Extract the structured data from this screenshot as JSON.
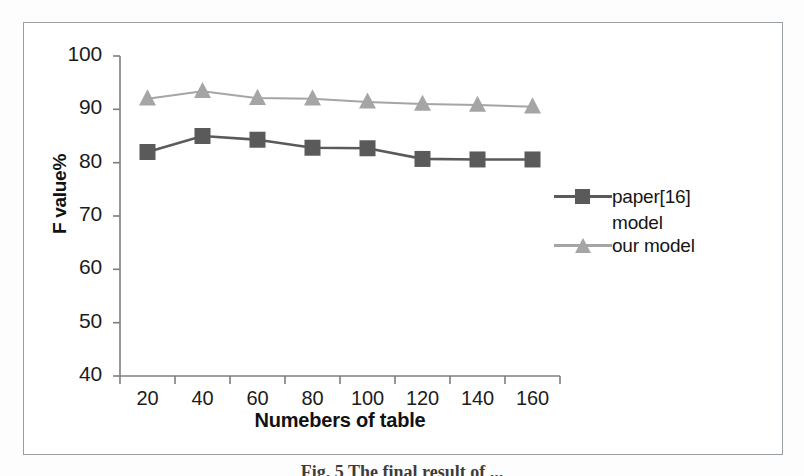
{
  "figure": {
    "caption": "Fig. 5 The final result of ..."
  },
  "chart_data": {
    "type": "line",
    "title": "",
    "xlabel": "Numebers of table",
    "ylabel": "F value%",
    "categories": [
      "20",
      "40",
      "60",
      "80",
      "100",
      "120",
      "140",
      "160"
    ],
    "ylim": [
      40,
      100
    ],
    "yticks": [
      40,
      50,
      60,
      70,
      80,
      90,
      100
    ],
    "ytick_labels": [
      "40",
      "50",
      "60",
      "70",
      "80",
      "90",
      "100"
    ],
    "grid": false,
    "legend_position": "right",
    "series": [
      {
        "name": "paper[16] model",
        "legend_line1": "paper[16]",
        "legend_line2": "model",
        "marker": "square",
        "color": "#5a5a5a",
        "values": [
          82.0,
          85.0,
          84.3,
          82.8,
          82.7,
          80.7,
          80.6,
          80.6
        ]
      },
      {
        "name": "our model",
        "legend_line1": "our model",
        "legend_line2": "",
        "marker": "triangle",
        "color": "#a5a5a5",
        "values": [
          92.0,
          93.4,
          92.1,
          92.0,
          91.4,
          91.0,
          90.8,
          90.5
        ]
      }
    ]
  }
}
